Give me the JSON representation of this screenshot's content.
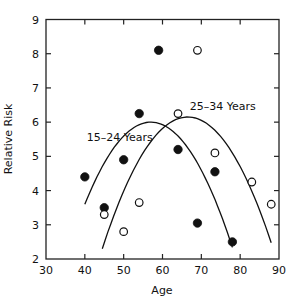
{
  "chart_data": {
    "type": "scatter",
    "title": "",
    "xlabel": "Age",
    "ylabel": "Relative Risk",
    "xlim": [
      30,
      90
    ],
    "ylim": [
      2,
      9
    ],
    "xticks": [
      30,
      40,
      50,
      60,
      70,
      80,
      90
    ],
    "yticks": [
      2,
      3,
      4,
      5,
      6,
      7,
      8,
      9
    ],
    "grid": false,
    "series": [
      {
        "name": "15-24 Years",
        "marker": "filled-circle",
        "points": [
          [
            40,
            4.4
          ],
          [
            45,
            3.5
          ],
          [
            50,
            4.9
          ],
          [
            54,
            6.25
          ],
          [
            59,
            8.1
          ],
          [
            64,
            5.2
          ],
          [
            69,
            3.05
          ],
          [
            73.5,
            4.55
          ],
          [
            78,
            2.5
          ]
        ]
      },
      {
        "name": "25-34 Years",
        "marker": "open-circle",
        "points": [
          [
            45,
            3.3
          ],
          [
            50,
            2.8
          ],
          [
            54,
            3.65
          ],
          [
            64,
            6.25
          ],
          [
            69,
            8.1
          ],
          [
            73.5,
            5.1
          ],
          [
            83,
            4.25
          ],
          [
            88,
            3.6
          ]
        ]
      }
    ],
    "fits": [
      {
        "name": "15-24 Years",
        "type": "quadratic",
        "x_range": [
          40,
          78
        ],
        "peak": [
          57,
          6.0
        ],
        "start_y": 3.6
      },
      {
        "name": "25-34 Years",
        "type": "quadratic",
        "x_range": [
          44.5,
          88
        ],
        "peak": [
          66.5,
          6.15
        ],
        "start_y": 2.3
      }
    ],
    "annotations": [
      {
        "text": "15–24 Years",
        "at": [
          40.5,
          5.45
        ]
      },
      {
        "text": "25–34 Years",
        "at": [
          67,
          6.35
        ]
      }
    ]
  }
}
